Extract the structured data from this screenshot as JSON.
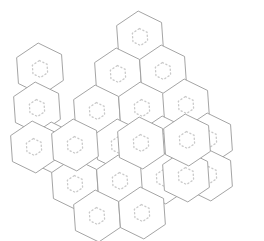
{
  "figure": {
    "type": "hexagon-tiling",
    "background_color": "#ffffff",
    "outline_color": "#9a9a9a",
    "inner_ring_color": "#c9c9c9",
    "outline_width": 0.9,
    "cell_count": 21,
    "orientation": "pointy-top",
    "rotation_degrees": -4,
    "canvas": {
      "width": 264,
      "height": 241
    }
  },
  "geometry": {
    "hex_radius": 26,
    "column_spacing": 45,
    "row_spacing": 39,
    "inner_ring_radius": 8.5,
    "dash_pattern": "1.2 2.6"
  },
  "chart_data": {
    "type": "scatter",
    "xlabel": "",
    "ylabel": "",
    "xlim": [
      0,
      264
    ],
    "ylim": [
      0,
      241
    ],
    "grid": false,
    "legend": "none",
    "marker": "hexagon-outline-with-dotted-ring",
    "categories": [
      "r0c0",
      "r0c1",
      "r0c2",
      "r1c0",
      "r1c1",
      "r1c2",
      "r1c3",
      "r2c0",
      "r2c1",
      "r2c2",
      "r2c3",
      "r3c0",
      "r3c1",
      "r3c2",
      "r3c3",
      "r4c0",
      "r4c1",
      "r4c2",
      "r4c3",
      "r5c0",
      "r5c1"
    ],
    "cells": [
      {
        "id": "r0c0",
        "row": 0,
        "col": 3,
        "cx": 140,
        "cy": 37
      },
      {
        "id": "r0c1",
        "row": 1,
        "col": 2,
        "cx": 118,
        "cy": 74
      },
      {
        "id": "r0c2",
        "row": 1,
        "col": 4,
        "cx": 163,
        "cy": 71
      },
      {
        "id": "r1c0",
        "row": 1,
        "col": 0,
        "cx": 40,
        "cy": 69
      },
      {
        "id": "r1c1",
        "row": 2,
        "col": 3,
        "cx": 142,
        "cy": 108
      },
      {
        "id": "r1c2",
        "row": 2,
        "col": 5,
        "cx": 186,
        "cy": 105
      },
      {
        "id": "r1c3",
        "row": 2,
        "col": 1,
        "cx": 37,
        "cy": 108
      },
      {
        "id": "r2c0",
        "row": 2,
        "col": 2,
        "cx": 97,
        "cy": 111
      },
      {
        "id": "r2c1",
        "row": 3,
        "col": 2,
        "cx": 119,
        "cy": 145
      },
      {
        "id": "r2c2",
        "row": 3,
        "col": 4,
        "cx": 164,
        "cy": 142
      },
      {
        "id": "r2c3",
        "row": 3,
        "col": 6,
        "cx": 209,
        "cy": 139
      },
      {
        "id": "r3c0",
        "row": 3,
        "col": 0,
        "cx": 53,
        "cy": 148
      },
      {
        "id": "r3c1",
        "row": 4,
        "col": 1,
        "cx": 75,
        "cy": 184
      },
      {
        "id": "r3c2",
        "row": 4,
        "col": 3,
        "cx": 120,
        "cy": 181
      },
      {
        "id": "r3c3",
        "row": 4,
        "col": 5,
        "cx": 186,
        "cy": 176
      },
      {
        "id": "r4c0",
        "row": 5,
        "col": 0,
        "cx": 34,
        "cy": 147
      },
      {
        "id": "r4c1",
        "row": 5,
        "col": 2,
        "cx": 75,
        "cy": 145
      },
      {
        "id": "r4c2",
        "row": 5,
        "col": 4,
        "cx": 141,
        "cy": 143
      },
      {
        "id": "r4c3",
        "row": 5,
        "col": 6,
        "cx": 187,
        "cy": 140
      },
      {
        "id": "r5c0",
        "row": 6,
        "col": 1,
        "cx": 97,
        "cy": 216
      },
      {
        "id": "r5c1",
        "row": 6,
        "col": 3,
        "cx": 142,
        "cy": 213
      }
    ],
    "values": [
      1,
      1,
      1,
      1,
      1,
      1,
      1,
      1,
      1,
      1,
      1,
      1,
      1,
      1,
      1,
      1,
      1,
      1,
      1,
      1,
      1
    ]
  },
  "layout": {
    "rows": [
      {
        "index": 0,
        "cells": [
          {
            "cx": 140,
            "cy": 37
          }
        ]
      },
      {
        "index": 1,
        "cells": [
          {
            "cx": 40,
            "cy": 69
          },
          {
            "cx": 118,
            "cy": 74
          },
          {
            "cx": 163,
            "cy": 71
          }
        ]
      },
      {
        "index": 2,
        "cells": [
          {
            "cx": 37,
            "cy": 108
          },
          {
            "cx": 97,
            "cy": 111
          },
          {
            "cx": 142,
            "cy": 108
          },
          {
            "cx": 186,
            "cy": 105
          }
        ]
      },
      {
        "index": 3,
        "cells": [
          {
            "cx": 53,
            "cy": 148
          },
          {
            "cx": 119,
            "cy": 145
          },
          {
            "cx": 164,
            "cy": 142
          },
          {
            "cx": 209,
            "cy": 139
          }
        ]
      },
      {
        "index": 4,
        "cells": [
          {
            "cx": 75,
            "cy": 184
          },
          {
            "cx": 120,
            "cy": 181
          },
          {
            "cx": 164,
            "cy": 178
          },
          {
            "cx": 209,
            "cy": 175
          }
        ]
      },
      {
        "index": 5,
        "cells": [
          {
            "cx": 97,
            "cy": 216
          },
          {
            "cx": 142,
            "cy": 213
          }
        ]
      }
    ]
  }
}
